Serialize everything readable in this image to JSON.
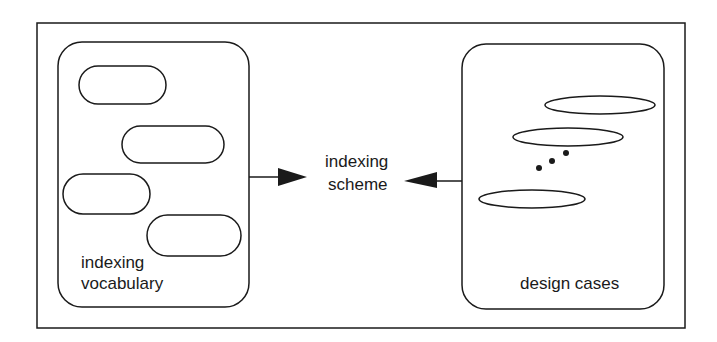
{
  "diagram": {
    "left_group": {
      "label_line1": "indexing",
      "label_line2": "vocabulary",
      "item_count": 4
    },
    "center": {
      "label_line1": "indexing",
      "label_line2": "scheme"
    },
    "right_group": {
      "label": "design cases",
      "item_count": 3,
      "ellipsis": "..."
    },
    "arrows": [
      {
        "from": "indexing vocabulary",
        "to": "indexing scheme"
      },
      {
        "from": "design cases",
        "to": "indexing scheme"
      }
    ],
    "stroke_color": "#1a1a1a",
    "background": "#ffffff"
  }
}
